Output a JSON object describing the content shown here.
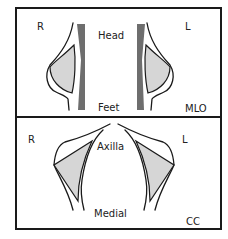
{
  "panels": {
    "mlo": {
      "view_label": "MLO",
      "left_side_label": "R",
      "right_side_label": "L",
      "top_label": "Head",
      "bottom_label": "Feet"
    },
    "cc": {
      "view_label": "CC",
      "left_side_label": "R",
      "right_side_label": "L",
      "top_label": "Axilla",
      "bottom_label": "Medial"
    }
  },
  "colors": {
    "frame": "#1a1a1a",
    "muscle": "#6e6e6e",
    "tissue": "#d6d6d6",
    "background": "#ffffff"
  }
}
